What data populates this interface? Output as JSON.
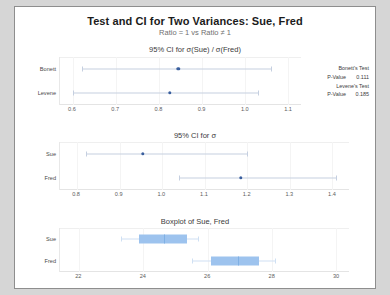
{
  "title": "Test and CI for Two Variances: Sue, Fred",
  "subtitle": "Ratio = 1 vs Ratio ≠ 1",
  "panels": {
    "ratio_ci": {
      "title": "95% CI for σ(Sue) / σ(Fred)",
      "rows": [
        {
          "label": "Bonett",
          "lower": 0.62,
          "estimate": 0.845,
          "upper": 1.06
        },
        {
          "label": "Levene",
          "lower": 0.6,
          "estimate": 0.825,
          "upper": 1.03
        }
      ],
      "ticks": [
        "0.6",
        "0.7",
        "0.8",
        "0.9",
        "1.0",
        "1.1"
      ],
      "tick_values": [
        0.6,
        0.7,
        0.8,
        0.9,
        1.0,
        1.1
      ],
      "axis_min": 0.57,
      "axis_max": 1.13
    },
    "sigma_ci": {
      "title": "95% CI for σ",
      "rows": [
        {
          "label": "Sue",
          "lower": 0.82,
          "estimate": 0.955,
          "upper": 1.2
        },
        {
          "label": "Fred",
          "lower": 1.04,
          "estimate": 1.185,
          "upper": 1.41
        }
      ],
      "ticks": [
        "0.8",
        "0.9",
        "1.0",
        "1.1",
        "1.2",
        "1.3",
        "1.4"
      ],
      "tick_values": [
        0.8,
        0.9,
        1.0,
        1.1,
        1.2,
        1.3,
        1.4
      ],
      "axis_min": 0.76,
      "axis_max": 1.44
    },
    "boxplot": {
      "title": "Boxplot of Sue, Fred",
      "rows": [
        {
          "label": "Sue",
          "whisker_low": 23.3,
          "q1": 23.85,
          "median": 24.65,
          "q3": 25.35,
          "whisker_high": 25.7
        },
        {
          "label": "Fred",
          "whisker_low": 25.5,
          "q1": 26.1,
          "median": 26.95,
          "q3": 27.6,
          "whisker_high": 28.1
        }
      ],
      "ticks": [
        "22",
        "24",
        "26",
        "28",
        "30"
      ],
      "tick_values": [
        22,
        24,
        26,
        28,
        30
      ],
      "axis_min": 21.4,
      "axis_max": 30.4
    }
  },
  "stats": {
    "bonett_heading": "Bonett's Test",
    "bonett_pvalue_label": "P-Value",
    "bonett_pvalue": "0.111",
    "levene_heading": "Levene's Test",
    "levene_pvalue_label": "P-Value",
    "levene_pvalue": "0.185"
  },
  "colors": {
    "box_fill": "#9dc3ee",
    "ci_dot": "#3a5f9e",
    "ci_line": "#c5cfe0"
  }
}
